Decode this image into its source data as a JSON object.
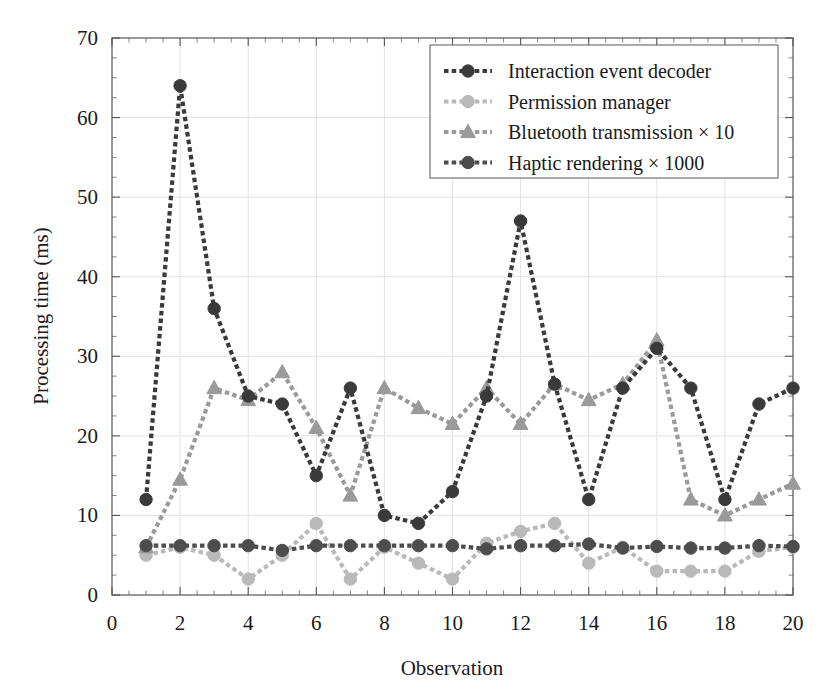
{
  "chart_data": {
    "type": "line",
    "title": "",
    "xlabel": "Observation",
    "ylabel": "Processing time (ms)",
    "xlim": [
      0,
      20
    ],
    "ylim": [
      0,
      70
    ],
    "xticks": [
      0,
      2,
      4,
      6,
      8,
      10,
      12,
      14,
      16,
      18,
      20
    ],
    "yticks": [
      0,
      10,
      20,
      30,
      40,
      50,
      60,
      70
    ],
    "xtick_labels": [
      "0",
      "2",
      "4",
      "6",
      "8",
      "10",
      "12",
      "14",
      "16",
      "18",
      "20"
    ],
    "ytick_labels": [
      "0",
      "10",
      "20",
      "30",
      "40",
      "50",
      "60",
      "70"
    ],
    "grid": true,
    "legend_position": "upper right",
    "x": [
      1,
      2,
      3,
      4,
      5,
      6,
      7,
      8,
      9,
      10,
      11,
      12,
      13,
      14,
      15,
      16,
      17,
      18,
      19,
      20
    ],
    "series": [
      {
        "name": "Interaction event decoder",
        "color": "#3a3a3a",
        "marker": "circle",
        "values": [
          12,
          64,
          36,
          25,
          24,
          15,
          26,
          10,
          9,
          13,
          25,
          47,
          26.5,
          12,
          26,
          31,
          26,
          12,
          24,
          26
        ]
      },
      {
        "name": "Permission manager",
        "color": "#b9b9b9",
        "marker": "circle",
        "values": [
          5,
          6,
          5,
          2,
          5,
          9,
          2,
          6,
          4,
          2,
          6.5,
          8,
          9,
          4,
          6,
          3,
          3,
          3,
          5.5,
          6
        ]
      },
      {
        "name": "Bluetooth transmission × 10",
        "color": "#9a9a9a",
        "marker": "triangle",
        "values": [
          6,
          14.5,
          26,
          24.5,
          28,
          21,
          12.5,
          26,
          23.5,
          21.5,
          26,
          21.5,
          26.5,
          24.5,
          26.5,
          32,
          12,
          10,
          12,
          14
        ]
      },
      {
        "name": "Haptic rendering × 1000",
        "color": "#4d4d4d",
        "marker": "circle",
        "values": [
          6.2,
          6.2,
          6.2,
          6.2,
          5.6,
          6.2,
          6.2,
          6.2,
          6.2,
          6.2,
          5.8,
          6.2,
          6.2,
          6.4,
          5.9,
          6.1,
          5.9,
          5.9,
          6.2,
          6.1
        ]
      }
    ],
    "legend_entries": [
      "Interaction event decoder",
      "Permission manager",
      "Bluetooth transmission × 10",
      "Haptic rendering × 1000"
    ]
  }
}
